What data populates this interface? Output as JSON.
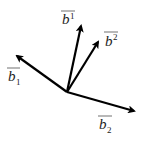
{
  "diagram": {
    "title": "",
    "origin": [
      67,
      92
    ],
    "stroke_color": "#000000",
    "vectors": [
      {
        "id": "b_1",
        "symbol": "b",
        "index": "1",
        "index_position": "sub",
        "tip": [
          15,
          55
        ]
      },
      {
        "id": "b^1",
        "symbol": "b",
        "index": "1",
        "index_position": "sup",
        "tip": [
          81,
          24
        ]
      },
      {
        "id": "b^2",
        "symbol": "b",
        "index": "2",
        "index_position": "sup",
        "tip": [
          100,
          40
        ]
      },
      {
        "id": "b_2",
        "symbol": "b",
        "index": "2",
        "index_position": "sub",
        "tip": [
          137,
          112
        ]
      }
    ],
    "labels": {
      "b_1": {
        "base": "b",
        "index": "1"
      },
      "b_sup1": {
        "base": "b",
        "index": "1"
      },
      "b_sup2": {
        "base": "b",
        "index": "2"
      },
      "b_2": {
        "base": "b",
        "index": "2"
      }
    }
  }
}
